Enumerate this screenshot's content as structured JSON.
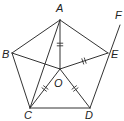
{
  "diagram": {
    "type": "geometry",
    "shape": "regular pentagon ABCDE (B-A-E top, C-D bottom) with center O",
    "points": [
      {
        "id": "A",
        "label": "A",
        "x": 60,
        "y": 20,
        "lx": 56,
        "ly": 3
      },
      {
        "id": "B",
        "label": "B",
        "x": 12,
        "y": 53,
        "lx": 2,
        "ly": 49
      },
      {
        "id": "E",
        "label": "E",
        "x": 108,
        "y": 53,
        "lx": 111,
        "ly": 49
      },
      {
        "id": "O",
        "label": "O",
        "x": 60,
        "y": 69,
        "lx": 54,
        "ly": 78
      },
      {
        "id": "C",
        "label": "C",
        "x": 30,
        "y": 108,
        "lx": 24,
        "ly": 110
      },
      {
        "id": "D",
        "label": "D",
        "x": 90,
        "y": 108,
        "lx": 85,
        "ly": 110
      },
      {
        "id": "F",
        "label": "F",
        "x": 120,
        "y": 25,
        "lx": 115,
        "ly": 10
      }
    ],
    "segments": [
      [
        "A",
        "B"
      ],
      [
        "A",
        "E"
      ],
      [
        "B",
        "C"
      ],
      [
        "C",
        "D"
      ],
      [
        "D",
        "F"
      ],
      [
        "A",
        "O"
      ],
      [
        "B",
        "O"
      ],
      [
        "O",
        "E"
      ],
      [
        "O",
        "C"
      ],
      [
        "O",
        "D"
      ],
      [
        "A",
        "C"
      ]
    ],
    "equal_marks": [
      "AO",
      "OE",
      "OC",
      "OD"
    ],
    "stroke_color": "#333333"
  }
}
